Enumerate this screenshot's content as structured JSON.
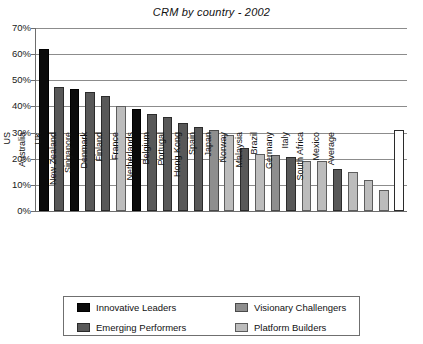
{
  "chart_data": {
    "type": "bar",
    "title": "CRM by country - 2002",
    "xlabel": "",
    "ylabel": "",
    "ylim": [
      0,
      70
    ],
    "ytick_labels": [
      "70%",
      "60%",
      "50%",
      "40%",
      "30%",
      "20%",
      "10%",
      "0%"
    ],
    "ytick_values": [
      70,
      60,
      50,
      40,
      30,
      20,
      10,
      0
    ],
    "grid": true,
    "legend_position": "bottom",
    "categories": [
      "Canada",
      "Ireland",
      "US",
      "Australia",
      "UK",
      "New Zealand",
      "Singapore",
      "Denmark",
      "Finland",
      "France",
      "Netherlands",
      "Belgium",
      "Portugal",
      "Hong Kong",
      "Spain",
      "Japan",
      "Norway",
      "Malaysia",
      "Brazil",
      "Germany",
      "Italy",
      "South Africa",
      "Mexico",
      "Average"
    ],
    "values": [
      62,
      47.5,
      46.5,
      45.5,
      44,
      40,
      39,
      37,
      36,
      33.5,
      32,
      31,
      29,
      24,
      22,
      21.5,
      20.5,
      19,
      19,
      16,
      15,
      12,
      8,
      31
    ],
    "bar_styles": [
      "black",
      "dark",
      "black",
      "dark",
      "dark",
      "light",
      "black",
      "dark",
      "dark",
      "dark",
      "dark",
      "medium",
      "light",
      "dark",
      "light",
      "medium",
      "dark",
      "light",
      "light",
      "dark",
      "light",
      "light",
      "light",
      "white"
    ],
    "legend": [
      {
        "label": "Innovative Leaders",
        "style": "black"
      },
      {
        "label": "Visionary Challengers",
        "style": "medium"
      },
      {
        "label": "Emerging Performers",
        "style": "dark"
      },
      {
        "label": "Platform Builders",
        "style": "light"
      }
    ],
    "colors": {
      "innovative_leaders": "#0b0b0b",
      "emerging_performers": "#585858",
      "visionary_challengers": "#8e8e8e",
      "platform_builders": "#bcbcbc",
      "average": "#ffffff",
      "gridline": "#8c8c8c",
      "axis": "#6d6d6d",
      "background": "#ffffff"
    }
  }
}
